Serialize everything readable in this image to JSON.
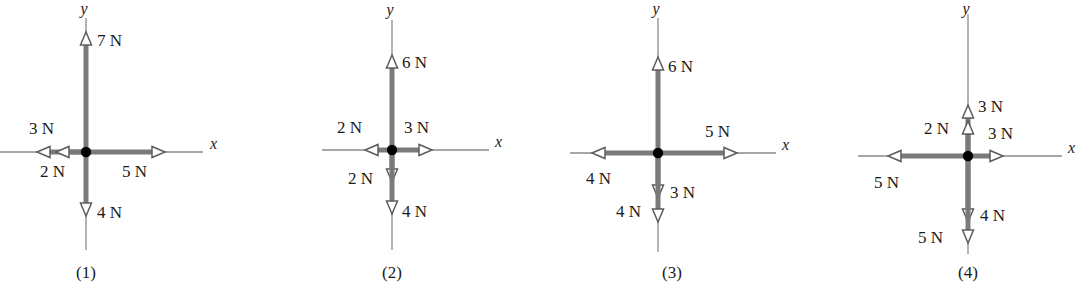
{
  "figure": {
    "units": "N",
    "colors": {
      "axis": "#8a8a8a",
      "vector": "#7a7a7a",
      "arrow_outline": "#5d5d5d",
      "arrow_fill": "#ffffff",
      "origin_dot": "#000000",
      "text": "#1a1a1a",
      "background": "#ffffff"
    },
    "panels": [
      {
        "id": "panel-1",
        "label": "(1)",
        "axis_x_label": "x",
        "axis_y_label": "y",
        "origin": {
          "x": 86,
          "y": 152
        },
        "axis": {
          "x_left": 0,
          "x_right": 203,
          "y_top": 18,
          "y_bottom": 250
        },
        "label_pos": {
          "x": 86,
          "y": 278
        },
        "axis_x_label_pos": {
          "x": 210,
          "y": 149
        },
        "axis_y_label_pos": {
          "x": 84,
          "y": 14
        },
        "vectors": [
          {
            "name": "up-7N",
            "magnitude": "7 N",
            "direction": "up",
            "tip": 32,
            "label_pos": {
              "x": 97,
              "y": 46
            },
            "anchor": "start"
          },
          {
            "name": "down-4N",
            "magnitude": "4 N",
            "direction": "down",
            "tip": 216,
            "label_pos": {
              "x": 97,
              "y": 218
            },
            "anchor": "start"
          },
          {
            "name": "left-3N",
            "magnitude": "3 N",
            "direction": "left",
            "tip": 37,
            "label_pos": {
              "x": 29,
              "y": 134
            },
            "anchor": "start"
          },
          {
            "name": "left-2N",
            "magnitude": "2 N",
            "direction": "left",
            "tip": 56,
            "label_pos": {
              "x": 40,
              "y": 177
            },
            "anchor": "start"
          },
          {
            "name": "right-5N",
            "magnitude": "5 N",
            "direction": "right",
            "tip": 165,
            "label_pos": {
              "x": 122,
              "y": 177
            },
            "anchor": "start"
          }
        ]
      },
      {
        "id": "panel-2",
        "label": "(2)",
        "axis_x_label": "x",
        "axis_y_label": "y",
        "origin": {
          "x": 392,
          "y": 150
        },
        "axis": {
          "x_left": 322,
          "x_right": 489,
          "y_top": 20,
          "y_bottom": 250
        },
        "label_pos": {
          "x": 392,
          "y": 278
        },
        "axis_x_label_pos": {
          "x": 495,
          "y": 147
        },
        "axis_y_label_pos": {
          "x": 390,
          "y": 15
        },
        "vectors": [
          {
            "name": "up-6N",
            "magnitude": "6 N",
            "direction": "up",
            "tip": 55,
            "label_pos": {
              "x": 402,
              "y": 68
            },
            "anchor": "start"
          },
          {
            "name": "down-2N",
            "magnitude": "2 N",
            "direction": "down",
            "tip": 182,
            "label_pos": {
              "x": 348,
              "y": 184
            },
            "anchor": "start"
          },
          {
            "name": "down-4N",
            "magnitude": "4 N",
            "direction": "down",
            "tip": 214,
            "label_pos": {
              "x": 402,
              "y": 217
            },
            "anchor": "start"
          },
          {
            "name": "left-2N",
            "magnitude": "2 N",
            "direction": "left",
            "tip": 365,
            "label_pos": {
              "x": 337,
              "y": 133
            },
            "anchor": "start"
          },
          {
            "name": "right-3N",
            "magnitude": "3 N",
            "direction": "right",
            "tip": 432,
            "label_pos": {
              "x": 404,
              "y": 133
            },
            "anchor": "start"
          }
        ]
      },
      {
        "id": "panel-3",
        "label": "(3)",
        "axis_x_label": "x",
        "axis_y_label": "y",
        "origin": {
          "x": 658,
          "y": 153
        },
        "axis": {
          "x_left": 570,
          "x_right": 776,
          "y_top": 18,
          "y_bottom": 252
        },
        "label_pos": {
          "x": 672,
          "y": 278
        },
        "axis_x_label_pos": {
          "x": 782,
          "y": 150
        },
        "axis_y_label_pos": {
          "x": 656,
          "y": 14
        },
        "vectors": [
          {
            "name": "up-6N",
            "magnitude": "6 N",
            "direction": "up",
            "tip": 57,
            "label_pos": {
              "x": 668,
              "y": 72
            },
            "anchor": "start"
          },
          {
            "name": "down-3N",
            "magnitude": "3 N",
            "direction": "down",
            "tip": 198,
            "label_pos": {
              "x": 670,
              "y": 198
            },
            "anchor": "start"
          },
          {
            "name": "down-4N",
            "magnitude": "4 N",
            "direction": "down",
            "tip": 222,
            "label_pos": {
              "x": 616,
              "y": 217
            },
            "anchor": "start"
          },
          {
            "name": "left-4N",
            "magnitude": "4 N",
            "direction": "left",
            "tip": 592,
            "label_pos": {
              "x": 586,
              "y": 184
            },
            "anchor": "start"
          },
          {
            "name": "right-5N",
            "magnitude": "5 N",
            "direction": "right",
            "tip": 737,
            "label_pos": {
              "x": 705,
              "y": 137
            },
            "anchor": "start"
          }
        ]
      },
      {
        "id": "panel-4",
        "label": "(4)",
        "axis_x_label": "x",
        "axis_y_label": "y",
        "origin": {
          "x": 968,
          "y": 156
        },
        "axis": {
          "x_left": 858,
          "x_right": 1062,
          "y_top": 14,
          "y_bottom": 254
        },
        "label_pos": {
          "x": 968,
          "y": 278
        },
        "axis_x_label_pos": {
          "x": 1068,
          "y": 153
        },
        "axis_y_label_pos": {
          "x": 966,
          "y": 14
        },
        "vectors": [
          {
            "name": "up-3N",
            "magnitude": "3 N",
            "direction": "up",
            "tip": 105,
            "label_pos": {
              "x": 978,
              "y": 112
            },
            "anchor": "start"
          },
          {
            "name": "up-2N",
            "magnitude": "2 N",
            "direction": "up",
            "tip": 121,
            "label_pos": {
              "x": 924,
              "y": 134
            },
            "anchor": "start"
          },
          {
            "name": "down-4N",
            "magnitude": "4 N",
            "direction": "down",
            "tip": 222,
            "label_pos": {
              "x": 980,
              "y": 221
            },
            "anchor": "start"
          },
          {
            "name": "down-5N",
            "magnitude": "5 N",
            "direction": "down",
            "tip": 243,
            "label_pos": {
              "x": 918,
              "y": 243
            },
            "anchor": "start"
          },
          {
            "name": "left-5N",
            "magnitude": "5 N",
            "direction": "left",
            "tip": 888,
            "label_pos": {
              "x": 874,
              "y": 188
            },
            "anchor": "start"
          },
          {
            "name": "right-3N",
            "magnitude": "3 N",
            "direction": "right",
            "tip": 1003,
            "label_pos": {
              "x": 988,
              "y": 139
            },
            "anchor": "start"
          }
        ]
      }
    ]
  }
}
